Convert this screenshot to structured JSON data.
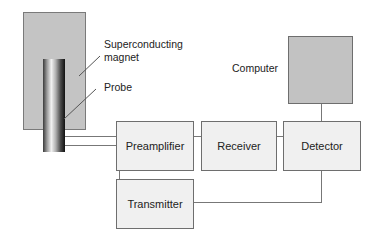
{
  "diagram": {
    "labels": {
      "magnet_line1": "Superconducting",
      "magnet_line2": "magnet",
      "probe": "Probe",
      "computer": "Computer"
    },
    "blocks": {
      "preamplifier": "Preamplifier",
      "receiver": "Receiver",
      "detector": "Detector",
      "transmitter": "Transmitter"
    },
    "connections": [
      {
        "from": "Probe",
        "to": "Preamplifier"
      },
      {
        "from": "Preamplifier",
        "to": "Receiver"
      },
      {
        "from": "Receiver",
        "to": "Detector"
      },
      {
        "from": "Detector",
        "to": "Computer"
      },
      {
        "from": "Detector",
        "to": "Transmitter"
      },
      {
        "from": "Transmitter",
        "to": "Preamplifier"
      }
    ],
    "colors": {
      "magnet_fill": "#c4c4c4",
      "computer_fill": "#c2c2c2",
      "block_fill": "#f0f0f0",
      "line": "#777777"
    }
  }
}
